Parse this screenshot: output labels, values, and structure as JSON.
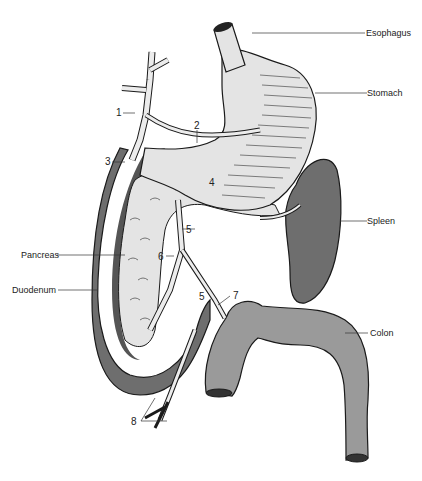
{
  "diagram": {
    "type": "anatomical illustration",
    "labels": {
      "esophagus": "Esophagus",
      "stomach": "Stomach",
      "spleen": "Spleen",
      "pancreas": "Pancreas",
      "duodenum": "Duodenum",
      "colon": "Colon"
    },
    "numbers": {
      "n1": "1",
      "n2": "2",
      "n3": "3",
      "n4": "4",
      "n5a": "5",
      "n5b": "5",
      "n6": "6",
      "n7": "7",
      "n8": "8"
    },
    "colors": {
      "organ_dark": "#6e6e6e",
      "organ_mid": "#9a9a9a",
      "organ_light": "#e4e4e4",
      "vessel_fill": "#ececec",
      "outline": "#1a1a1a"
    }
  }
}
